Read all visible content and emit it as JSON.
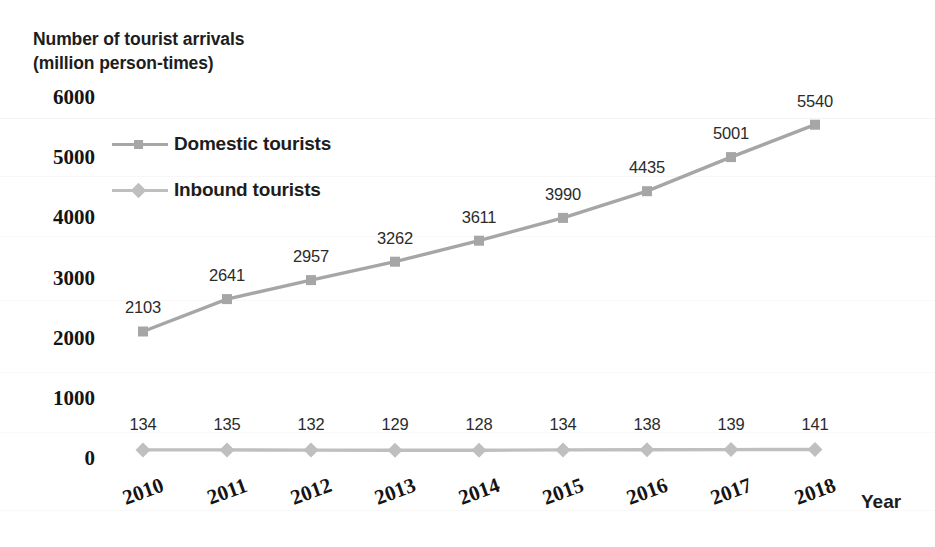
{
  "chart_data": {
    "type": "line",
    "title": "Number of tourist arrivals (million person-times)",
    "title_line1": "Number of tourist arrivals",
    "title_line2": "(million person-times)",
    "xlabel": "Year",
    "ylabel": "Number of tourist arrivals (million person-times)",
    "categories": [
      "2010",
      "2011",
      "2012",
      "2013",
      "2014",
      "2015",
      "2016",
      "2017",
      "2018"
    ],
    "ylim": [
      0,
      6000
    ],
    "yticks": [
      0,
      1000,
      2000,
      3000,
      4000,
      5000,
      6000
    ],
    "ytick_labels": [
      "0",
      "1000",
      "2000",
      "3000",
      "4000",
      "5000",
      "6000"
    ],
    "grid": false,
    "legend_position": "top-left",
    "data_labels": true,
    "series": [
      {
        "name": "Domestic tourists",
        "marker": "square",
        "color": "#a6a6a6",
        "values": [
          2103,
          2641,
          2957,
          3262,
          3611,
          3990,
          4435,
          5001,
          5540
        ],
        "labels": [
          "2103",
          "2641",
          "2957",
          "3262",
          "3611",
          "3990",
          "4435",
          "5001",
          "5540"
        ]
      },
      {
        "name": "Inbound tourists",
        "marker": "diamond",
        "color": "#bfbfbf",
        "values": [
          134,
          135,
          132,
          129,
          128,
          134,
          138,
          139,
          141
        ],
        "labels": [
          "134",
          "135",
          "132",
          "129",
          "128",
          "134",
          "138",
          "139",
          "141"
        ]
      }
    ]
  },
  "colors": {
    "domestic": "#a6a6a6",
    "inbound": "#bfbfbf",
    "text": "#1d1d1d",
    "background": "#ffffff"
  }
}
